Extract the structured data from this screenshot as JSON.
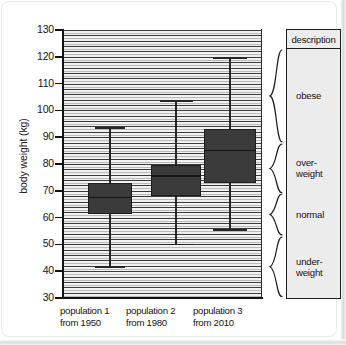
{
  "chart_data": {
    "type": "box",
    "title": "",
    "xlabel": "",
    "ylabel": "body weight (kg)",
    "ylim": [
      30,
      130
    ],
    "yticks": [
      130,
      120,
      110,
      100,
      90,
      80,
      70,
      60,
      50,
      40,
      30
    ],
    "grid": "horizontal-hatch",
    "legend": "none",
    "categories": [
      "population 1\nfrom 1950",
      "population 2\nfrom 1980",
      "population 3\nfrom 2010"
    ],
    "series": [
      {
        "name": "population 1 from 1950",
        "label_line1": "population 1",
        "label_line2": "from 1950",
        "whisker_low": 41.5,
        "q1": 61.5,
        "median": 67.5,
        "q3": 73.0,
        "whisker_high": 93.5
      },
      {
        "name": "population 2 from 1980",
        "label_line1": "population 2",
        "label_line2": "from 1980",
        "whisker_low": 50.0,
        "q1": 68.0,
        "median": 75.5,
        "q3": 79.5,
        "whisker_high": 103.5
      },
      {
        "name": "population 3 from 2010",
        "label_line1": "population 3",
        "label_line2": "from 2010",
        "whisker_low": 55.5,
        "q1": 73.0,
        "median": 85.0,
        "q3": 93.0,
        "whisker_high": 119.5
      }
    ],
    "annotations": {
      "description_header": "description",
      "bands": [
        {
          "label": "obese",
          "label_line1": "obese",
          "label_line2": "",
          "from": 123.0,
          "to": 88.0
        },
        {
          "label": "over-weight",
          "label_line1": "over-",
          "label_line2": "weight",
          "from": 88.0,
          "to": 69.0
        },
        {
          "label": "normal",
          "label_line1": "normal",
          "label_line2": "",
          "from": 69.0,
          "to": 53.0
        },
        {
          "label": "under-weight",
          "label_line1": "under-",
          "label_line2": "weight",
          "from": 53.0,
          "to": 30.0
        }
      ]
    },
    "colors": {
      "box_fill": "#3b3b3b",
      "box_stroke": "#1d1d1d",
      "whisker": "#262626",
      "axis": "#111111",
      "panel_bg": "#ececec",
      "page_bg": "#ffffff",
      "text": "#141414"
    }
  }
}
